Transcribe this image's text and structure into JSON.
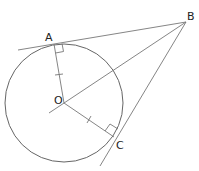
{
  "diagram": {
    "type": "geometry",
    "points": {
      "A": {
        "label": "A",
        "x": 52,
        "y": 45
      },
      "B": {
        "label": "B",
        "x": 186,
        "y": 22
      },
      "C": {
        "label": "C",
        "x": 115,
        "y": 138
      },
      "O": {
        "label": "O",
        "x": 64,
        "y": 103
      }
    },
    "circle": {
      "center": "O",
      "radius": 59
    },
    "colors": {
      "stroke": "#666666",
      "text": "#222222"
    }
  }
}
